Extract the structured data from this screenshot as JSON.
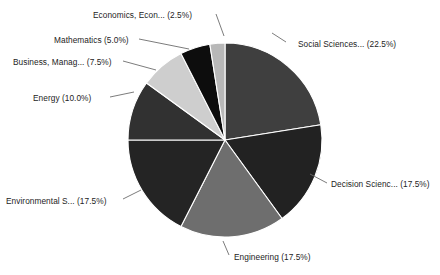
{
  "chart_data": {
    "type": "pie",
    "title": "",
    "subtitle": "",
    "legend_position": "none",
    "grid": false,
    "start_angle_deg": 90,
    "direction": "clockwise",
    "center": {
      "x": 225,
      "y": 140
    },
    "radius": 97,
    "categories": [
      "Social Sciences...",
      "Decision Scienc...",
      "Engineering",
      "Environmental S...",
      "Energy",
      "Business, Manag...",
      "Mathematics",
      "Economics, Econ..."
    ],
    "values": [
      22.5,
      17.5,
      17.5,
      17.5,
      10.0,
      7.5,
      5.0,
      2.5
    ],
    "value_unit": "%",
    "colors": [
      "#3f3f3f",
      "#222222",
      "#6e6e6e",
      "#242424",
      "#313131",
      "#cecece",
      "#0d0d0d",
      "#b8b8b8"
    ],
    "slices": [
      {
        "label": "Social Sciences...",
        "value": 22.5,
        "display": "Social Sciences... (22.5%)",
        "color": "#3f3f3f",
        "start_deg": 0,
        "end_deg": 81,
        "label_x": 298,
        "label_y": 47,
        "anchor": "start",
        "leader": "M 286,42 L 272,33"
      },
      {
        "label": "Decision Scienc...",
        "value": 17.5,
        "display": "Decision Scienc... (17.5%)",
        "color": "#222222",
        "start_deg": 81,
        "end_deg": 144,
        "label_x": 331,
        "label_y": 187,
        "anchor": "start",
        "leader": "M 327,183 L 310,174"
      },
      {
        "label": "Engineering",
        "value": 17.5,
        "display": "Engineering (17.5%)",
        "color": "#6e6e6e",
        "start_deg": 144,
        "end_deg": 207,
        "label_x": 234,
        "label_y": 260,
        "anchor": "start",
        "leader": "M 229,255 L 223,241"
      },
      {
        "label": "Environmental S...",
        "value": 17.5,
        "display": "Environmental S... (17.5%)",
        "color": "#242424",
        "start_deg": 207,
        "end_deg": 270,
        "label_x": 6,
        "label_y": 204,
        "anchor": "start",
        "leader": "M 123,199 L 141,190"
      },
      {
        "label": "Energy",
        "value": 10.0,
        "display": "Energy (10.0%)",
        "color": "#313131",
        "start_deg": 270,
        "end_deg": 306,
        "label_x": 33,
        "label_y": 101,
        "anchor": "start",
        "leader": "M 110,97 L 134,92"
      },
      {
        "label": "Business, Manag...",
        "value": 7.5,
        "display": "Business, Manag... (7.5%)",
        "color": "#cecece",
        "start_deg": 306,
        "end_deg": 333,
        "label_x": 13,
        "label_y": 65,
        "anchor": "start",
        "leader": "M 123,61 L 156,70"
      },
      {
        "label": "Mathematics",
        "value": 5.0,
        "display": "Mathematics (5.0%)",
        "color": "#0d0d0d",
        "start_deg": 333,
        "end_deg": 351,
        "label_x": 54,
        "label_y": 43,
        "anchor": "start",
        "leader": "M 139,39 L 189,49"
      },
      {
        "label": "Economics, Econ...",
        "value": 2.5,
        "display": "Economics, Econ... (2.5%)",
        "color": "#b8b8b8",
        "start_deg": 351,
        "end_deg": 360,
        "label_x": 93,
        "label_y": 18,
        "anchor": "start",
        "leader": "M 216,14 L 224,36"
      }
    ]
  }
}
